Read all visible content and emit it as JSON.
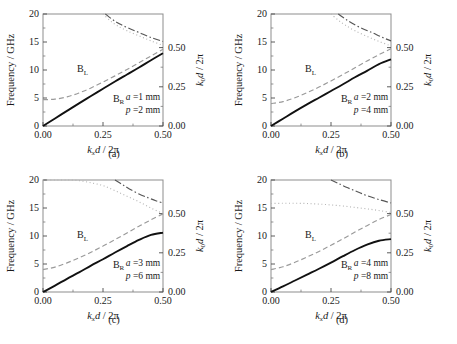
{
  "figure": {
    "bottom_caption": "",
    "panels": [
      {
        "id": "a",
        "caption": "(a)",
        "params": {
          "a": "a =1 mm",
          "p": "p =2 mm"
        },
        "labels": {
          "bl": "B",
          "bl_sub": "L",
          "br": "B",
          "br_sub": "R"
        },
        "axes": {
          "ylabel": "Frequency / GHz",
          "xlabel_main": "k",
          "xlabel_sub": "x",
          "xlabel_tail": "d / 2π",
          "y2label_main": "k",
          "y2label_sub": "0",
          "y2label_tail": "d / 2π",
          "xticks": [
            "0.00",
            "0.25",
            "0.50"
          ],
          "yticks": [
            "0",
            "5",
            "10",
            "15",
            "20"
          ],
          "y2ticks": [
            "0.00",
            "0.25",
            "0.50"
          ],
          "xlim": [
            0.0,
            0.5
          ],
          "ylim": [
            0,
            20
          ],
          "y2lim": [
            0.0,
            0.715
          ]
        },
        "chart_data": {
          "type": "line",
          "title": "(a)",
          "xlabel": "kxd/2π",
          "ylabel": "Frequency / GHz",
          "y2label": "k0d/2π",
          "xlim": [
            0.0,
            0.5
          ],
          "ylim": [
            0,
            20
          ],
          "series": [
            {
              "name": "B_R",
              "style": "solid",
              "color": "#111111",
              "x": [
                0.0,
                0.05,
                0.1,
                0.15,
                0.2,
                0.25,
                0.3,
                0.35,
                0.4,
                0.45,
                0.5
              ],
              "y": [
                0.0,
                1.35,
                2.7,
                4.05,
                5.35,
                6.65,
                7.95,
                9.2,
                10.45,
                11.75,
                13.0
              ]
            },
            {
              "name": "B_L",
              "style": "dashed",
              "color": "#9a9a9a",
              "x": [
                0.0,
                0.05,
                0.1,
                0.15,
                0.2,
                0.25,
                0.3,
                0.35,
                0.4,
                0.45,
                0.5
              ],
              "y": [
                4.7,
                4.8,
                5.2,
                5.9,
                6.8,
                7.85,
                8.95,
                10.1,
                11.3,
                12.5,
                13.7
              ]
            },
            {
              "name": "band-dashdot",
              "style": "dashdot",
              "color": "#555555",
              "x": [
                0.26,
                0.29,
                0.32,
                0.36,
                0.4,
                0.45,
                0.5
              ],
              "y": [
                20.0,
                19.0,
                18.2,
                17.4,
                16.7,
                15.8,
                15.1
              ]
            },
            {
              "name": "band-dotted",
              "style": "dotted",
              "color": "#b5b5b5",
              "x": [
                0.25,
                0.28,
                0.31,
                0.35,
                0.4,
                0.45,
                0.5
              ],
              "y": [
                20.0,
                18.8,
                17.9,
                17.0,
                16.1,
                15.2,
                14.4
              ]
            }
          ]
        }
      },
      {
        "id": "b",
        "caption": "(b)",
        "params": {
          "a": "a =2 mm",
          "p": "p =4 mm"
        },
        "labels": {
          "bl": "B",
          "bl_sub": "L",
          "br": "B",
          "br_sub": "R"
        },
        "axes": {
          "ylabel": "Frequency / GHz",
          "xlabel_main": "k",
          "xlabel_sub": "x",
          "xlabel_tail": "d / 2π",
          "y2label_main": "k",
          "y2label_sub": "0",
          "y2label_tail": "d / 2π",
          "xticks": [
            "0.00",
            "0.25",
            "0.50"
          ],
          "yticks": [
            "0",
            "5",
            "10",
            "15",
            "20"
          ],
          "y2ticks": [
            "0.00",
            "0.25",
            "0.50"
          ],
          "xlim": [
            0.0,
            0.5
          ],
          "ylim": [
            0,
            20
          ],
          "y2lim": [
            0.0,
            0.715
          ]
        },
        "chart_data": {
          "type": "line",
          "title": "(b)",
          "xlabel": "kxd/2π",
          "ylabel": "Frequency / GHz",
          "y2label": "k0d/2π",
          "xlim": [
            0.0,
            0.5
          ],
          "ylim": [
            0,
            20
          ],
          "series": [
            {
              "name": "B_R",
              "style": "solid",
              "color": "#111111",
              "x": [
                0.0,
                0.05,
                0.1,
                0.15,
                0.2,
                0.25,
                0.3,
                0.35,
                0.4,
                0.45,
                0.5
              ],
              "y": [
                0.0,
                1.3,
                2.6,
                3.85,
                5.05,
                6.25,
                7.45,
                8.7,
                9.85,
                11.05,
                11.9
              ]
            },
            {
              "name": "B_L",
              "style": "dashed",
              "color": "#9a9a9a",
              "x": [
                0.0,
                0.05,
                0.1,
                0.15,
                0.2,
                0.25,
                0.3,
                0.35,
                0.4,
                0.45,
                0.5
              ],
              "y": [
                4.0,
                4.35,
                5.05,
                5.95,
                6.95,
                8.05,
                9.2,
                10.4,
                11.6,
                12.75,
                13.8
              ]
            },
            {
              "name": "band-dashdot",
              "style": "dashdot",
              "color": "#555555",
              "x": [
                0.28,
                0.31,
                0.34,
                0.38,
                0.42,
                0.46,
                0.5
              ],
              "y": [
                20.0,
                19.1,
                18.3,
                17.4,
                16.7,
                15.9,
                15.2
              ]
            },
            {
              "name": "band-dotted",
              "style": "dotted",
              "color": "#b5b5b5",
              "x": [
                0.25,
                0.28,
                0.31,
                0.35,
                0.4,
                0.45,
                0.5
              ],
              "y": [
                20.0,
                18.9,
                18.0,
                17.0,
                16.0,
                15.1,
                14.3
              ]
            }
          ]
        }
      },
      {
        "id": "c",
        "caption": "(c)",
        "params": {
          "a": "a =3 mm",
          "p": "p =6 mm"
        },
        "labels": {
          "bl": "B",
          "bl_sub": "L",
          "br": "B",
          "br_sub": "R"
        },
        "axes": {
          "ylabel": "Frequency / GHz",
          "xlabel_main": "k",
          "xlabel_sub": "x",
          "xlabel_tail": "d / 2π",
          "y2label_main": "k",
          "y2label_sub": "0",
          "y2label_tail": "d / 2π",
          "xticks": [
            "0.00",
            "0.25",
            "0.50"
          ],
          "yticks": [
            "0",
            "5",
            "10",
            "15",
            "20"
          ],
          "y2ticks": [
            "0.00",
            "0.25",
            "0.50"
          ],
          "xlim": [
            0.0,
            0.5
          ],
          "ylim": [
            0,
            20
          ],
          "y2lim": [
            0.0,
            0.715
          ]
        },
        "chart_data": {
          "type": "line",
          "title": "(c)",
          "xlabel": "kxd/2π",
          "ylabel": "Frequency / GHz",
          "y2label": "k0d/2π",
          "xlim": [
            0.0,
            0.5
          ],
          "ylim": [
            0,
            20
          ],
          "series": [
            {
              "name": "B_R",
              "style": "solid",
              "color": "#111111",
              "x": [
                0.0,
                0.05,
                0.1,
                0.15,
                0.2,
                0.25,
                0.3,
                0.35,
                0.4,
                0.45,
                0.5
              ],
              "y": [
                0.0,
                1.15,
                2.35,
                3.5,
                4.7,
                5.85,
                7.05,
                8.2,
                9.3,
                10.2,
                10.6
              ]
            },
            {
              "name": "B_L",
              "style": "dashed",
              "color": "#9a9a9a",
              "x": [
                0.0,
                0.05,
                0.1,
                0.15,
                0.2,
                0.25,
                0.3,
                0.35,
                0.4,
                0.45,
                0.5
              ],
              "y": [
                4.0,
                4.45,
                5.2,
                6.1,
                7.1,
                8.2,
                9.35,
                10.55,
                11.75,
                12.9,
                13.95
              ]
            },
            {
              "name": "band-dashdot",
              "style": "dashdot",
              "color": "#555555",
              "x": [
                0.3,
                0.33,
                0.36,
                0.4,
                0.44,
                0.47,
                0.5
              ],
              "y": [
                20.0,
                19.2,
                18.4,
                17.5,
                16.8,
                16.3,
                15.9
              ]
            },
            {
              "name": "band-dotted",
              "style": "dotted",
              "color": "#b5b5b5",
              "x": [
                0.0,
                0.05,
                0.1,
                0.15,
                0.2,
                0.25,
                0.3,
                0.35,
                0.4,
                0.45,
                0.5
              ],
              "y": [
                20.0,
                20.0,
                20.0,
                19.9,
                19.5,
                19.0,
                18.1,
                17.1,
                16.1,
                15.0,
                14.0
              ]
            }
          ]
        }
      },
      {
        "id": "d",
        "caption": "(d)",
        "params": {
          "a": "a =4 mm",
          "p": "p =8 mm"
        },
        "labels": {
          "bl": "B",
          "bl_sub": "L",
          "br": "B",
          "br_sub": "R"
        },
        "axes": {
          "ylabel": "Frequency / GHz",
          "xlabel_main": "k",
          "xlabel_sub": "x",
          "xlabel_tail": "d / 2π",
          "y2label_main": "k",
          "y2label_sub": "0",
          "y2label_tail": "d / 2π",
          "xticks": [
            "0.00",
            "0.25",
            "0.50"
          ],
          "yticks": [
            "0",
            "5",
            "10",
            "15",
            "20"
          ],
          "y2ticks": [
            "0.00",
            "0.25",
            "0.50"
          ],
          "xlim": [
            0.0,
            0.5
          ],
          "ylim": [
            0,
            20
          ],
          "y2lim": [
            0.0,
            0.715
          ]
        },
        "chart_data": {
          "type": "line",
          "title": "(d)",
          "xlabel": "kxd/2π",
          "ylabel": "Frequency / GHz",
          "y2label": "k0d/2π",
          "xlim": [
            0.0,
            0.5
          ],
          "ylim": [
            0,
            20
          ],
          "series": [
            {
              "name": "B_R",
              "style": "solid",
              "color": "#111111",
              "x": [
                0.0,
                0.05,
                0.1,
                0.15,
                0.2,
                0.25,
                0.3,
                0.35,
                0.4,
                0.45,
                0.5
              ],
              "y": [
                0.0,
                1.0,
                2.05,
                3.1,
                4.15,
                5.25,
                6.4,
                7.5,
                8.45,
                9.15,
                9.45
              ]
            },
            {
              "name": "B_L",
              "style": "dashed",
              "color": "#9a9a9a",
              "x": [
                0.0,
                0.05,
                0.1,
                0.15,
                0.2,
                0.25,
                0.3,
                0.35,
                0.4,
                0.45,
                0.5
              ],
              "y": [
                4.0,
                4.5,
                5.3,
                6.25,
                7.25,
                8.35,
                9.5,
                10.7,
                11.85,
                12.95,
                13.85
              ]
            },
            {
              "name": "band-dashdot",
              "style": "dashdot",
              "color": "#555555",
              "x": [
                0.25,
                0.28,
                0.32,
                0.36,
                0.4,
                0.45,
                0.5
              ],
              "y": [
                20.0,
                19.4,
                18.6,
                17.9,
                17.2,
                16.5,
                15.9
              ]
            },
            {
              "name": "band-dotted",
              "style": "dotted",
              "color": "#b5b5b5",
              "x": [
                0.0,
                0.05,
                0.1,
                0.15,
                0.2,
                0.25,
                0.3,
                0.35,
                0.4,
                0.45,
                0.5
              ],
              "y": [
                15.8,
                15.85,
                15.85,
                15.8,
                15.7,
                15.55,
                15.35,
                15.1,
                14.85,
                14.55,
                14.2
              ]
            }
          ]
        }
      }
    ]
  }
}
